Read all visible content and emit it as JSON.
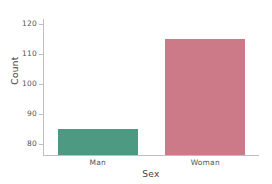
{
  "chart_data": {
    "type": "bar",
    "title": "",
    "subtitle": "",
    "xlabel": "Sex",
    "ylabel": "Count",
    "categories": [
      "Man",
      "Woman"
    ],
    "values": [
      85,
      115
    ],
    "colors": [
      "#4c9a81",
      "#cc7a87"
    ],
    "ylim": [
      76.4,
      121.5
    ],
    "yticks": [
      80,
      90,
      100,
      110,
      120
    ],
    "ytick_labels": [
      "80",
      "90",
      "100",
      "110",
      "120"
    ],
    "xticks": [
      0,
      1
    ],
    "xtick_labels": [
      "Man",
      "Woman"
    ],
    "grid": false,
    "legend": null,
    "legend_position": "none",
    "annotations": [],
    "axis_color": "#bfbfbf",
    "tick_label_color": "#555555",
    "axis_label_color": "#444444",
    "background": "#ffffff"
  }
}
